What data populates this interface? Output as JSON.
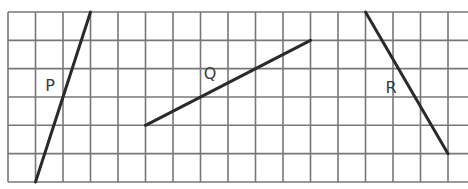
{
  "diagram": {
    "type": "grid-line-segments",
    "grid": {
      "origin_x": 8,
      "origin_y": 12,
      "cell_w": 27.5,
      "cell_h": 28.33,
      "rows": 6,
      "cols": 16,
      "right_edge": 468,
      "line_color": "#777777",
      "segment_color": "#2a2a2a"
    },
    "segments": [
      {
        "id": "P",
        "label": "P",
        "from": [
          1,
          6
        ],
        "to": [
          3,
          0
        ],
        "label_pos": [
          50,
          91
        ]
      },
      {
        "id": "Q",
        "label": "Q",
        "from": [
          5,
          4
        ],
        "to": [
          11,
          1
        ],
        "label_pos": [
          210,
          79
        ]
      },
      {
        "id": "R",
        "label": "R",
        "from": [
          13,
          0
        ],
        "to": [
          16,
          5
        ],
        "label_pos": [
          391,
          93
        ]
      }
    ]
  }
}
